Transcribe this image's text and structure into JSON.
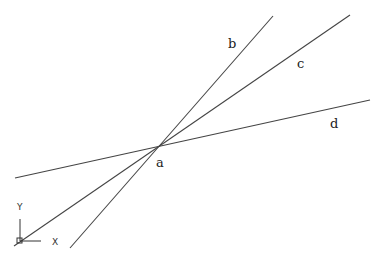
{
  "diagram": {
    "intersection": {
      "label": "a",
      "x": 159,
      "y": 147,
      "label_x": 157,
      "label_y": 167
    },
    "lines": [
      {
        "name": "b",
        "x1": 70,
        "y1": 248,
        "x2": 273,
        "y2": 16,
        "label_x": 228,
        "label_y": 48
      },
      {
        "name": "c",
        "x1": 14,
        "y1": 246,
        "x2": 350,
        "y2": 15,
        "label_x": 297,
        "label_y": 68
      },
      {
        "name": "d",
        "x1": 15,
        "y1": 178,
        "x2": 370,
        "y2": 100,
        "label_x": 330,
        "label_y": 128
      }
    ],
    "color": "#444444"
  },
  "ucs_icon": {
    "x_label": "X",
    "y_label": "Y"
  }
}
